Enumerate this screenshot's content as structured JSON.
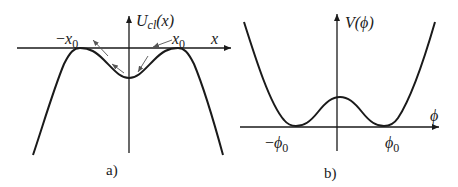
{
  "panel_a": {
    "caption": "a)",
    "y_label_main": "U",
    "y_label_sub": "cl",
    "y_label_arg": "(x)",
    "x_label": "x",
    "left_marker_sign": "−",
    "left_marker_var": "x",
    "left_marker_sub": "0",
    "right_marker_var": "x",
    "right_marker_sub": "0",
    "description": "Inverted double-well classical potential with maxima at ±x0 on the x-axis and a local minimum at the origin; arrows indicate motion along the curve"
  },
  "panel_b": {
    "caption": "b)",
    "y_label": "V(ϕ)",
    "x_label": "ϕ",
    "left_marker_sign": "−",
    "left_marker_var": "ϕ",
    "left_marker_sub": "0",
    "right_marker_var": "ϕ",
    "right_marker_sub": "0",
    "description": "Double-well potential with minima at ±ϕ0 on the axis and a local maximum at ϕ = 0"
  },
  "colors": {
    "curve": "#1a1a1a",
    "axis": "#1a1a1a",
    "arrow": "#555555",
    "background": "#ffffff"
  }
}
